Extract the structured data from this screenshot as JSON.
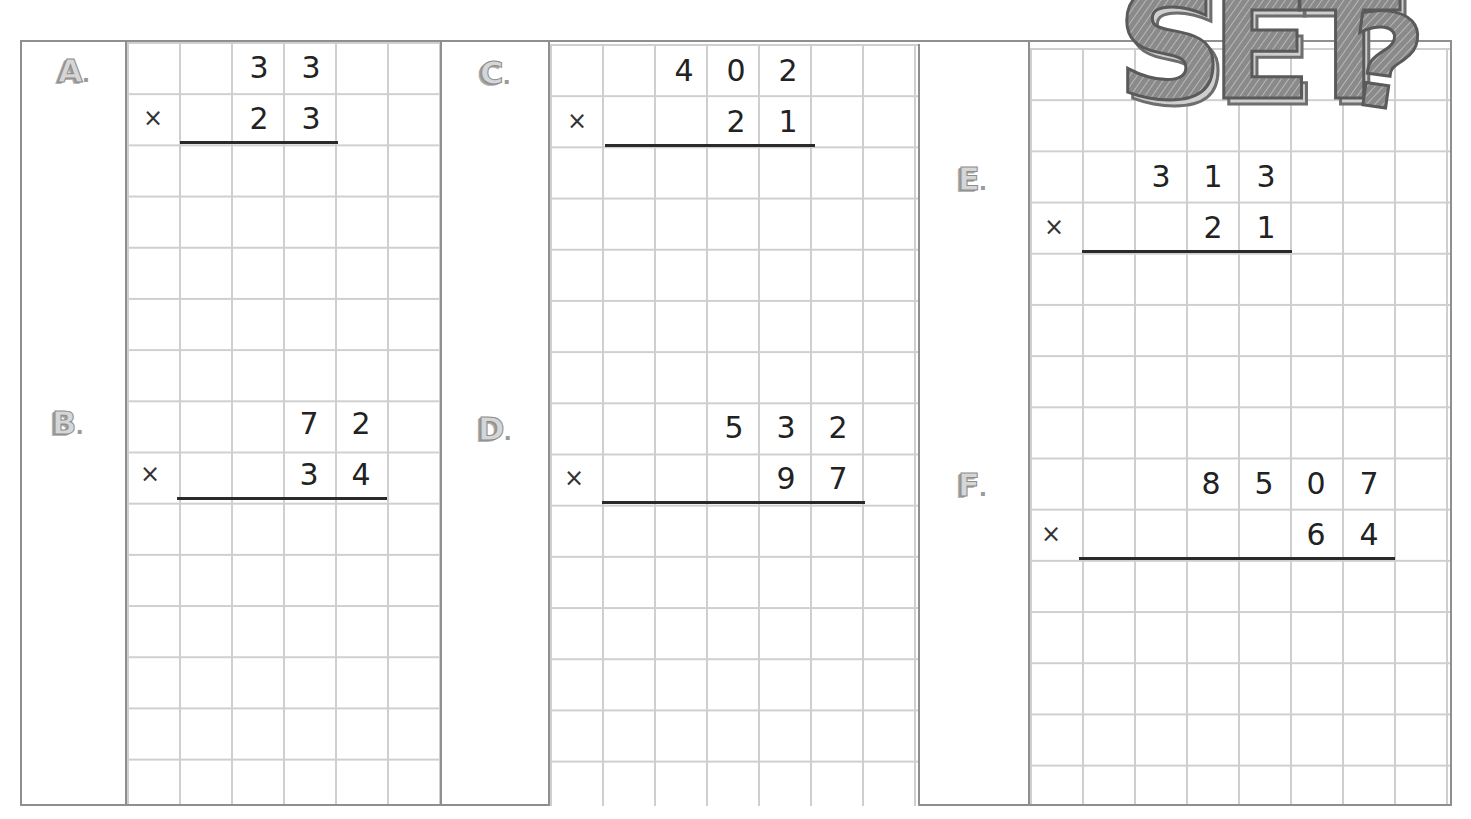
{
  "worksheet": {
    "title_art": "SET?",
    "operator_symbol": "×",
    "problems": [
      {
        "id": "A",
        "label": "A.",
        "multiplicand": [
          "3",
          "3"
        ],
        "multiplier": [
          "2",
          "3"
        ]
      },
      {
        "id": "B",
        "label": "B.",
        "multiplicand": [
          "7",
          "2"
        ],
        "multiplier": [
          "3",
          "4"
        ]
      },
      {
        "id": "C",
        "label": "C.",
        "multiplicand": [
          "4",
          "0",
          "2"
        ],
        "multiplier": [
          "2",
          "1"
        ]
      },
      {
        "id": "D",
        "label": "D.",
        "multiplicand": [
          "5",
          "3",
          "2"
        ],
        "multiplier": [
          "9",
          "7"
        ]
      },
      {
        "id": "E",
        "label": "E.",
        "multiplicand": [
          "3",
          "1",
          "3"
        ],
        "multiplier": [
          "2",
          "1"
        ]
      },
      {
        "id": "F",
        "label": "F.",
        "multiplicand": [
          "8",
          "5",
          "0",
          "7"
        ],
        "multiplier": [
          "6",
          "4"
        ]
      }
    ]
  },
  "colors": {
    "grid_line": "#cfcfcf",
    "border": "#8f8f8f",
    "digit": "#222222",
    "label_fill": "#d6d6d6"
  }
}
